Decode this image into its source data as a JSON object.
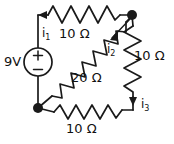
{
  "diagram": {
    "type": "electrical-schematic",
    "stroke_color": "#1a1a1a",
    "text_color": "#111111",
    "background_color": "#ffffff"
  },
  "source": {
    "label": "9V",
    "kind": "dc-voltage-source",
    "plus_sign": "+",
    "minus_sign": "−"
  },
  "resistors": [
    {
      "id": "r-top",
      "label": "10 Ω",
      "value": 10,
      "unit": "Ω",
      "position": "top"
    },
    {
      "id": "r-right",
      "label": "10 Ω",
      "value": 10,
      "unit": "Ω",
      "position": "right"
    },
    {
      "id": "r-middle",
      "label": "20 Ω",
      "value": 20,
      "unit": "Ω",
      "position": "middle-diagonal"
    },
    {
      "id": "r-bottom",
      "label": "10 Ω",
      "value": 10,
      "unit": "Ω",
      "position": "bottom"
    }
  ],
  "currents": [
    {
      "id": "i1",
      "base": "i",
      "subscript": "1",
      "label": "i1",
      "direction": "up-left",
      "branch": "source"
    },
    {
      "id": "i2",
      "base": "i",
      "subscript": "2",
      "label": "i2",
      "direction": "down-left",
      "branch": "middle-20-ohm"
    },
    {
      "id": "i3",
      "base": "i",
      "subscript": "3",
      "label": "i3",
      "direction": "down",
      "branch": "right-10-ohm"
    }
  ],
  "nodes": [
    {
      "id": "node-top-right",
      "x": 132,
      "y": 15
    },
    {
      "id": "node-bottom-left",
      "x": 38,
      "y": 108
    }
  ]
}
